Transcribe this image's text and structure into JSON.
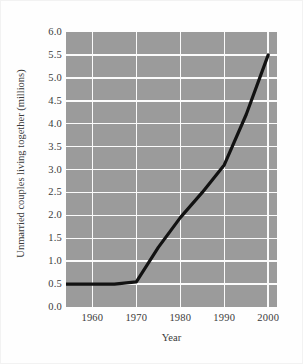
{
  "chart_data": {
    "type": "line",
    "title": "",
    "xlabel": "Year",
    "ylabel": "Unmarried couples living together (millions)",
    "xlim": [
      1954,
      2002
    ],
    "ylim": [
      0.0,
      6.0
    ],
    "grid": true,
    "legend": null,
    "x_ticks": [
      1960,
      1970,
      1980,
      1990,
      2000
    ],
    "x_tick_labels": [
      "1960",
      "1970",
      "1980",
      "1990",
      "2000"
    ],
    "y_ticks": [
      0.0,
      0.5,
      1.0,
      1.5,
      2.0,
      2.5,
      3.0,
      3.5,
      4.0,
      4.5,
      5.0,
      5.5,
      6.0
    ],
    "y_tick_labels": [
      "0.0",
      "0.5",
      "1.0",
      "1.5",
      "2.0",
      "2.5",
      "3.0",
      "3.5",
      "4.0",
      "4.5",
      "5.0",
      "5.5",
      "6.0"
    ],
    "series": [
      {
        "name": "Unmarried couples living together",
        "color": "#121212",
        "x": [
          1954,
          1960,
          1965,
          1970,
          1975,
          1980,
          1985,
          1990,
          1995,
          2000
        ],
        "values": [
          0.5,
          0.5,
          0.5,
          0.55,
          1.3,
          1.95,
          2.5,
          3.1,
          4.2,
          5.5
        ]
      }
    ],
    "colors": {
      "plot_background": "#9b9b9b",
      "gridline": "#fbfbfb",
      "line": "#121212",
      "text": "#3a3a3a",
      "page_background": "#fefefe"
    }
  }
}
